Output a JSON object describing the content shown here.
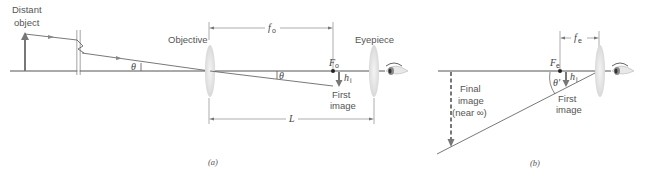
{
  "panel_a": {
    "caption": "(a)",
    "labels": {
      "distant_object_line1": "Distant",
      "distant_object_line2": "object",
      "objective": "Objective",
      "eyepiece": "Eyepiece",
      "first_image_line1": "First",
      "first_image_line2": "image",
      "theta": "θ",
      "theta_inner": "θ",
      "focal_length_o": "f",
      "focal_length_o_sub": "o",
      "focal_point_o": "F",
      "focal_point_o_sub": "o",
      "image_height": "h",
      "image_height_sub": "i",
      "length": "L"
    }
  },
  "panel_b": {
    "caption": "(b)",
    "labels": {
      "final_image_line1": "Final",
      "final_image_line2": "image",
      "final_image_line3": "(near ∞)",
      "first_image_line1": "First",
      "first_image_line2": "image",
      "theta_prime": "θ′",
      "focal_length_e": "f",
      "focal_length_e_sub": "e",
      "focal_point_e": "F",
      "focal_point_e_sub": "e",
      "image_height": "h",
      "image_height_sub": "i"
    }
  },
  "colors": {
    "line": "#555555",
    "arrow": "#777777",
    "lens": "#e4e4e4"
  }
}
